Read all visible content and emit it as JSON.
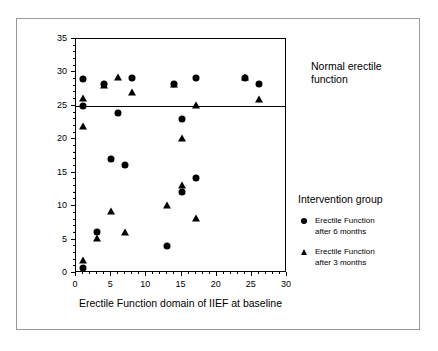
{
  "chart_data": {
    "type": "scatter",
    "title": "",
    "xlabel": "Erectile Function domain of IIEF at baseline",
    "ylabel": "Erectile Function domain of IIEF at 3 & 6 months",
    "xlim": [
      0,
      30
    ],
    "ylim": [
      0,
      35
    ],
    "xticks": [
      0,
      5,
      10,
      15,
      20,
      25,
      30
    ],
    "yticks": [
      0,
      5,
      10,
      15,
      20,
      25,
      30,
      35
    ],
    "xtick_labels": [
      "0",
      "5",
      "10",
      "15",
      "20",
      "25",
      "30"
    ],
    "ytick_labels": [
      "0",
      "5",
      "10",
      "15",
      "20",
      "25",
      "30",
      "35"
    ],
    "grid": false,
    "legend_position": "right",
    "legend_title": "Intervention group",
    "annotations": [
      {
        "name": "normal-erectile-function",
        "text": "Normal erectile function",
        "line1": "Normal erectile",
        "line2": "function",
        "reference_line_y": 25
      }
    ],
    "reference_lines": [
      {
        "axis": "y",
        "value": 25,
        "label": "Normal erectile function threshold"
      }
    ],
    "series": [
      {
        "name": "Erectile Function after 6 months",
        "label_line1": "Erectile Function",
        "label_line2": "after 6 months",
        "marker": "circle",
        "color": "#000000",
        "points": [
          {
            "x": 1,
            "y": 29
          },
          {
            "x": 1,
            "y": 25
          },
          {
            "x": 1,
            "y": 0.8
          },
          {
            "x": 3,
            "y": 6.1
          },
          {
            "x": 4,
            "y": 28.2
          },
          {
            "x": 5,
            "y": 17
          },
          {
            "x": 6,
            "y": 24
          },
          {
            "x": 7,
            "y": 16.1
          },
          {
            "x": 8,
            "y": 29.1
          },
          {
            "x": 13,
            "y": 4
          },
          {
            "x": 14,
            "y": 28.3
          },
          {
            "x": 15,
            "y": 23
          },
          {
            "x": 15,
            "y": 12.1
          },
          {
            "x": 17,
            "y": 29.1
          },
          {
            "x": 17,
            "y": 14.2
          },
          {
            "x": 24,
            "y": 29.2
          },
          {
            "x": 26,
            "y": 28.2
          }
        ]
      },
      {
        "name": "Erectile Function after 3 months",
        "label_line1": "Erectile Function",
        "label_line2": "after 3 months",
        "marker": "triangle",
        "color": "#000000",
        "points": [
          {
            "x": 1,
            "y": 26.2
          },
          {
            "x": 1,
            "y": 22
          },
          {
            "x": 1,
            "y": 1.9
          },
          {
            "x": 3,
            "y": 5.2
          },
          {
            "x": 4,
            "y": 28.1
          },
          {
            "x": 5,
            "y": 9.2
          },
          {
            "x": 6,
            "y": 29.3
          },
          {
            "x": 7,
            "y": 6.1
          },
          {
            "x": 8,
            "y": 27.1
          },
          {
            "x": 13,
            "y": 10.1
          },
          {
            "x": 14,
            "y": 28.3
          },
          {
            "x": 15,
            "y": 20.2
          },
          {
            "x": 15,
            "y": 13.2
          },
          {
            "x": 17,
            "y": 25.1
          },
          {
            "x": 17,
            "y": 8.2
          },
          {
            "x": 24,
            "y": 29.3
          },
          {
            "x": 26,
            "y": 26
          }
        ]
      }
    ]
  }
}
